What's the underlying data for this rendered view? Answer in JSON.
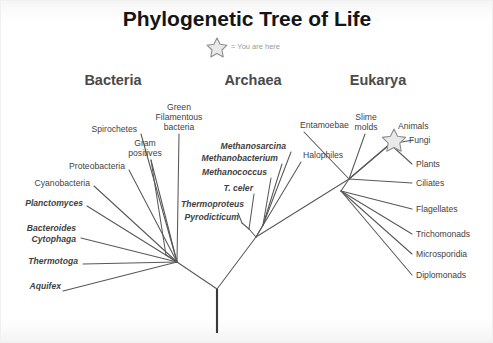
{
  "figure": {
    "title": "Phylogenetic Tree of Life",
    "legend_label": "= You are here",
    "legend_icon": "star-icon",
    "background_color": "#ffffff",
    "line_color": "#585858"
  },
  "domains": [
    {
      "key": "bacteria",
      "label": "Bacteria",
      "x": 112,
      "y": 79
    },
    {
      "key": "archaea",
      "label": "Archaea",
      "x": 252,
      "y": 79
    },
    {
      "key": "eukarya",
      "label": "Eukarya",
      "x": 377,
      "y": 79
    }
  ],
  "you_are_here": {
    "taxon": "Animals",
    "marker": "star-icon",
    "x": 393,
    "y": 139
  },
  "chart_data": {
    "type": "tree",
    "title": "Phylogenetic Tree of Life",
    "root": {
      "x": 216,
      "y": 332
    },
    "domains": [
      "Bacteria",
      "Archaea",
      "Eukarya"
    ],
    "taxa_count": 23,
    "taxa": [
      {
        "name": "Aquifex",
        "domain": "Bacteria",
        "style": "italic"
      },
      {
        "name": "Thermotoga",
        "domain": "Bacteria",
        "style": "italic"
      },
      {
        "name": "Bacteroides",
        "domain": "Bacteria",
        "style": "italic"
      },
      {
        "name": "Cytophaga",
        "domain": "Bacteria",
        "style": "italic"
      },
      {
        "name": "Planctomyces",
        "domain": "Bacteria",
        "style": "italic"
      },
      {
        "name": "Cyanobacteria",
        "domain": "Bacteria",
        "style": "plain"
      },
      {
        "name": "Proteobacteria",
        "domain": "Bacteria",
        "style": "plain"
      },
      {
        "name": "Spirochetes",
        "domain": "Bacteria",
        "style": "plain"
      },
      {
        "name": "Gram positives",
        "domain": "Bacteria",
        "style": "plain"
      },
      {
        "name": "Green Filamentous bacteria",
        "domain": "Bacteria",
        "style": "plain"
      },
      {
        "name": "Pyrodicticum",
        "domain": "Archaea",
        "style": "italic"
      },
      {
        "name": "Thermoproteus",
        "domain": "Archaea",
        "style": "italic"
      },
      {
        "name": "T. celer",
        "domain": "Archaea",
        "style": "italic"
      },
      {
        "name": "Methanococcus",
        "domain": "Archaea",
        "style": "italic"
      },
      {
        "name": "Methanobacterium",
        "domain": "Archaea",
        "style": "italic"
      },
      {
        "name": "Methanosarcina",
        "domain": "Archaea",
        "style": "italic"
      },
      {
        "name": "Halophiles",
        "domain": "Archaea",
        "style": "plain"
      },
      {
        "name": "Entamoebae",
        "domain": "Eukarya",
        "style": "plain"
      },
      {
        "name": "Slime molds",
        "domain": "Eukarya",
        "style": "plain"
      },
      {
        "name": "Animals",
        "domain": "Eukarya",
        "style": "plain"
      },
      {
        "name": "Fungi",
        "domain": "Eukarya",
        "style": "plain"
      },
      {
        "name": "Plants",
        "domain": "Eukarya",
        "style": "plain"
      },
      {
        "name": "Ciliates",
        "domain": "Eukarya",
        "style": "plain"
      },
      {
        "name": "Flagellates",
        "domain": "Eukarya",
        "style": "plain"
      },
      {
        "name": "Trichomonads",
        "domain": "Eukarya",
        "style": "plain"
      },
      {
        "name": "Microsporidia",
        "domain": "Eukarya",
        "style": "plain"
      },
      {
        "name": "Diplomonads",
        "domain": "Eukarya",
        "style": "plain"
      }
    ]
  },
  "labels": {
    "bacteria": [
      {
        "key": "spirochetes",
        "text": "Spirochetes",
        "style": "plain",
        "x": 136,
        "y": 131,
        "anchor": "end"
      },
      {
        "key": "green-filamentous-1",
        "text": "Green",
        "style": "plain",
        "x": 178,
        "y": 109,
        "anchor": "middle"
      },
      {
        "key": "green-filamentous-2",
        "text": "Filamentous",
        "style": "plain",
        "x": 178,
        "y": 119,
        "anchor": "middle"
      },
      {
        "key": "green-filamentous-3",
        "text": "bacteria",
        "style": "plain",
        "x": 178,
        "y": 129,
        "anchor": "middle"
      },
      {
        "key": "gram-positives-1",
        "text": "Gram",
        "style": "plain",
        "x": 144,
        "y": 145,
        "anchor": "middle"
      },
      {
        "key": "gram-positives-2",
        "text": "positives",
        "style": "plain",
        "x": 144,
        "y": 155,
        "anchor": "middle"
      },
      {
        "key": "proteobacteria",
        "text": "Proteobacteria",
        "style": "plain",
        "x": 124,
        "y": 168,
        "anchor": "end"
      },
      {
        "key": "cyanobacteria",
        "text": "Cyanobacteria",
        "style": "plain",
        "x": 89,
        "y": 185,
        "anchor": "end"
      },
      {
        "key": "planctomyces",
        "text": "Planctomyces",
        "style": "italic",
        "x": 82,
        "y": 205,
        "anchor": "end"
      },
      {
        "key": "bacteroides",
        "text": "Bacteroides",
        "style": "italic",
        "x": 75,
        "y": 230,
        "anchor": "end"
      },
      {
        "key": "cytophaga",
        "text": "Cytophaga",
        "style": "italic",
        "x": 75,
        "y": 241,
        "anchor": "end"
      },
      {
        "key": "thermotoga",
        "text": "Thermotoga",
        "style": "italic",
        "x": 77,
        "y": 263,
        "anchor": "end"
      },
      {
        "key": "aquifex",
        "text": "Aquifex",
        "style": "italic",
        "x": 60,
        "y": 288,
        "anchor": "end"
      }
    ],
    "archaea": [
      {
        "key": "methanosarcina",
        "text": "Methanosarcina",
        "style": "italic",
        "x": 285,
        "y": 148,
        "anchor": "end"
      },
      {
        "key": "methanobacterium",
        "text": "Methanobacterium",
        "style": "italic",
        "x": 277,
        "y": 160,
        "anchor": "end"
      },
      {
        "key": "methanococcus",
        "text": "Methanococcus",
        "style": "italic",
        "x": 266,
        "y": 174,
        "anchor": "end"
      },
      {
        "key": "t-celer",
        "text": "T. celer",
        "style": "italic",
        "x": 252,
        "y": 190,
        "anchor": "end"
      },
      {
        "key": "thermoproteus",
        "text": "Thermoproteus",
        "style": "italic",
        "x": 243,
        "y": 206,
        "anchor": "end"
      },
      {
        "key": "pyrodicticum",
        "text": "Pyrodicticum",
        "style": "italic",
        "x": 238,
        "y": 219,
        "anchor": "end"
      },
      {
        "key": "halophiles",
        "text": "Halophiles",
        "style": "plain",
        "x": 302,
        "y": 157,
        "anchor": "start"
      }
    ],
    "eukarya": [
      {
        "key": "entamoebae",
        "text": "Entamoebae",
        "style": "plain",
        "x": 299,
        "y": 127,
        "anchor": "start"
      },
      {
        "key": "slime-molds-1",
        "text": "Slime",
        "style": "plain",
        "x": 365,
        "y": 119,
        "anchor": "middle"
      },
      {
        "key": "slime-molds-2",
        "text": "molds",
        "style": "plain",
        "x": 365,
        "y": 129,
        "anchor": "middle"
      },
      {
        "key": "animals",
        "text": "Animals",
        "style": "plain",
        "x": 397,
        "y": 128,
        "anchor": "start"
      },
      {
        "key": "fungi",
        "text": "Fungi",
        "style": "plain",
        "x": 408,
        "y": 142,
        "anchor": "start"
      },
      {
        "key": "plants",
        "text": "Plants",
        "style": "plain",
        "x": 415,
        "y": 166,
        "anchor": "start"
      },
      {
        "key": "ciliates",
        "text": "Ciliates",
        "style": "plain",
        "x": 415,
        "y": 185,
        "anchor": "start"
      },
      {
        "key": "flagellates",
        "text": "Flagellates",
        "style": "plain",
        "x": 415,
        "y": 211,
        "anchor": "start"
      },
      {
        "key": "trichomonads",
        "text": "Trichomonads",
        "style": "plain",
        "x": 415,
        "y": 236,
        "anchor": "start"
      },
      {
        "key": "microsporidia",
        "text": "Microsporidia",
        "style": "plain",
        "x": 415,
        "y": 256,
        "anchor": "start"
      },
      {
        "key": "diplomonads",
        "text": "Diplomonads",
        "style": "plain",
        "x": 415,
        "y": 277,
        "anchor": "start"
      }
    ]
  },
  "branches": {
    "trunk": "M216,332 L216,288",
    "main": [
      "M216,288 L176,261",
      "M216,288 L255,236",
      "M255,236 L348,178"
    ],
    "bacteria": [
      "M176,261 L62,290",
      "M176,261 L82,263",
      "M176,261 L80,237",
      "M176,261 L86,205",
      "M176,261 L93,185",
      "M176,261 L128,169",
      "M176,261 L140,133",
      "M176,261 L150,159",
      "M176,261 L178,133",
      "M176,261 L165,254",
      "M165,254 L150,159"
    ],
    "archaea": [
      "M255,236 L248,228",
      "M248,228 L241,222",
      "M241,222 L237,212",
      "M248,228 L253,193",
      "M255,236 L262,224",
      "M262,224 L270,177",
      "M262,224 L281,163",
      "M262,224 L290,151",
      "M255,236 L300,161"
    ],
    "eukarya": [
      "M348,178 L303,131",
      "M348,178 L364,133",
      "M348,178 L389,143",
      "M348,178 L389,143",
      "M389,143 L412,139",
      "M389,143 L411,163",
      "M348,178 L411,182",
      "M348,178 L340,190",
      "M340,190 L411,208",
      "M340,190 L411,233",
      "M340,190 L411,253",
      "M340,190 L411,274"
    ]
  }
}
